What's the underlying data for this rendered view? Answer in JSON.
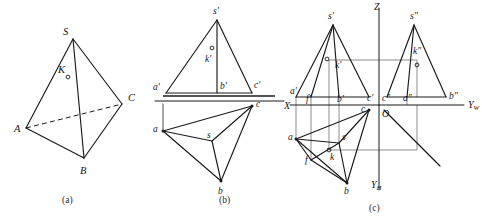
{
  "figure": {
    "panels": [
      {
        "id": "a",
        "caption": "(a)",
        "caption_x": 62,
        "caption_y": 203
      },
      {
        "id": "b",
        "caption": "(b)",
        "caption_x": 219,
        "caption_y": 203
      },
      {
        "id": "c",
        "caption": "(c)",
        "caption_x": 369,
        "caption_y": 211
      }
    ]
  },
  "panel_a": {
    "name": "pictorial-tetrahedron",
    "vertices": {
      "S": {
        "x": 73,
        "y": 39,
        "label": "S",
        "lx": 63,
        "ly": 35
      },
      "A": {
        "x": 26,
        "y": 128,
        "label": "A",
        "lx": 14,
        "ly": 132
      },
      "B": {
        "x": 84,
        "y": 158,
        "label": "B",
        "lx": 80,
        "ly": 174
      },
      "C": {
        "x": 122,
        "y": 104,
        "label": "C",
        "lx": 128,
        "ly": 101
      },
      "K": {
        "x": 68,
        "y": 77,
        "label": "K",
        "lx": 58,
        "ly": 73
      }
    },
    "edges": [
      {
        "from": "S",
        "to": "A",
        "style": "solid"
      },
      {
        "from": "S",
        "to": "B",
        "style": "solid"
      },
      {
        "from": "S",
        "to": "C",
        "style": "solid"
      },
      {
        "from": "A",
        "to": "B",
        "style": "solid"
      },
      {
        "from": "B",
        "to": "C",
        "style": "solid"
      },
      {
        "from": "A",
        "to": "C",
        "style": "dashed"
      }
    ]
  },
  "panel_b": {
    "name": "two-view-projection",
    "ground_line": {
      "x1": 163,
      "y1": 96,
      "x2": 275,
      "y2": 96
    },
    "xaxis_line": {
      "x1": 155,
      "y1": 101,
      "x2": 284,
      "y2": 101
    },
    "front_view": {
      "points": {
        "s_f": {
          "x": 217,
          "y": 20,
          "label": "s'",
          "lx": 213,
          "ly": 14
        },
        "a_f": {
          "x": 166,
          "y": 93,
          "label": "a'",
          "lx": 153,
          "ly": 90
        },
        "b_f": {
          "x": 217,
          "y": 93,
          "label": "b'",
          "lx": 220,
          "ly": 89
        },
        "c_f": {
          "x": 252,
          "y": 93,
          "label": "c'",
          "lx": 254,
          "ly": 88
        },
        "k_f": {
          "x": 212,
          "y": 55,
          "label": "k'",
          "lx": 205,
          "ly": 62
        }
      },
      "edges": [
        {
          "from": "s_f",
          "to": "a_f"
        },
        {
          "from": "s_f",
          "to": "c_f"
        },
        {
          "from": "s_f",
          "to": "b_f"
        },
        {
          "from": "a_f",
          "to": "c_f"
        }
      ]
    },
    "top_view": {
      "points": {
        "a_t": {
          "x": 163,
          "y": 131,
          "label": "a",
          "lx": 153,
          "ly": 132
        },
        "b_t": {
          "x": 221,
          "y": 181,
          "label": "b",
          "lx": 218,
          "ly": 194
        },
        "c_t": {
          "x": 252,
          "y": 106,
          "label": "c",
          "lx": 256,
          "ly": 107
        },
        "s_t": {
          "x": 212,
          "y": 141,
          "label": "s",
          "lx": 207,
          "ly": 138
        }
      },
      "edges": [
        {
          "from": "a_t",
          "to": "b_t"
        },
        {
          "from": "b_t",
          "to": "c_t"
        },
        {
          "from": "a_t",
          "to": "c_t"
        },
        {
          "from": "a_t",
          "to": "s_t"
        },
        {
          "from": "b_t",
          "to": "s_t"
        },
        {
          "from": "c_t",
          "to": "s_t"
        }
      ]
    }
  },
  "panel_c": {
    "name": "three-view-projection",
    "axes": {
      "origin": {
        "x": 379,
        "y": 105,
        "label": "O",
        "lx": 382,
        "ly": 117
      },
      "z_axis": {
        "x1": 379,
        "y1": 8,
        "x2": 379,
        "y2": 190,
        "label": "Z",
        "lx": 374,
        "ly": 10
      },
      "x_axis": {
        "x1": 290,
        "y1": 105,
        "x2": 379,
        "y2": 105,
        "label": "X",
        "lx": 284,
        "ly": 109
      },
      "yw_axis": {
        "x1": 379,
        "y1": 105,
        "x2": 464,
        "y2": 105,
        "label": "Y",
        "lx": 468,
        "ly": 108,
        "sub": "W"
      },
      "yh_axis": {
        "label": "Y",
        "lx": 371,
        "ly": 188,
        "sub": "H"
      },
      "miter_line": {
        "x1": 384,
        "y1": 110,
        "x2": 440,
        "y2": 166
      }
    },
    "front_view": {
      "points": {
        "s_f": {
          "x": 333,
          "y": 25,
          "label": "s'",
          "lx": 328,
          "ly": 19
        },
        "a_f": {
          "x": 296,
          "y": 97,
          "label": "a'",
          "lx": 290,
          "ly": 94
        },
        "f_f": {
          "x": 311,
          "y": 97,
          "label": "f'",
          "lx": 306,
          "ly": 102
        },
        "b_f": {
          "x": 339,
          "y": 97,
          "label": "b'",
          "lx": 337,
          "ly": 102
        },
        "c_f": {
          "x": 369,
          "y": 97,
          "label": "c'",
          "lx": 367,
          "ly": 101
        },
        "k_f": {
          "x": 329,
          "y": 60,
          "label": "k'",
          "lx": 335,
          "ly": 68
        }
      },
      "edges": [
        {
          "from": "s_f",
          "to": "a_f"
        },
        {
          "from": "s_f",
          "to": "c_f"
        },
        {
          "from": "s_f",
          "to": "b_f"
        },
        {
          "from": "s_f",
          "to": "f_f"
        },
        {
          "from": "a_f",
          "to": "c_f"
        }
      ]
    },
    "side_view": {
      "points": {
        "s_s": {
          "x": 414,
          "y": 25,
          "label": "s\"",
          "lx": 410,
          "ly": 19
        },
        "c_s": {
          "x": 387,
          "y": 97,
          "label": "c\"",
          "lx": 382,
          "ly": 101
        },
        "a_s": {
          "x": 407,
          "y": 97,
          "label": "a\"",
          "lx": 403,
          "ly": 101
        },
        "b_s": {
          "x": 446,
          "y": 97,
          "label": "b\"",
          "lx": 449,
          "ly": 99
        },
        "k_s": {
          "x": 417,
          "y": 60,
          "label": "k\"",
          "lx": 413,
          "ly": 54
        }
      },
      "edges": [
        {
          "from": "s_s",
          "to": "c_s"
        },
        {
          "from": "s_s",
          "to": "b_s"
        },
        {
          "from": "s_s",
          "to": "a_s"
        },
        {
          "from": "c_s",
          "to": "b_s"
        }
      ]
    },
    "top_view": {
      "points": {
        "a_t": {
          "x": 296,
          "y": 139,
          "label": "a",
          "lx": 288,
          "ly": 140
        },
        "b_t": {
          "x": 347,
          "y": 183,
          "label": "b",
          "lx": 344,
          "ly": 194
        },
        "c_t": {
          "x": 369,
          "y": 110,
          "label": "c",
          "lx": 361,
          "ly": 112
        },
        "s_t": {
          "x": 339,
          "y": 143,
          "label": "s",
          "lx": 342,
          "ly": 140
        },
        "f_t": {
          "x": 311,
          "y": 160,
          "label": "f",
          "lx": 305,
          "ly": 163
        },
        "k_t": {
          "x": 329,
          "y": 150,
          "label": "k",
          "lx": 330,
          "ly": 160
        }
      },
      "edges": [
        {
          "from": "a_t",
          "to": "b_t"
        },
        {
          "from": "b_t",
          "to": "c_t"
        },
        {
          "from": "a_t",
          "to": "c_t"
        },
        {
          "from": "a_t",
          "to": "s_t"
        },
        {
          "from": "b_t",
          "to": "s_t"
        },
        {
          "from": "c_t",
          "to": "s_t"
        },
        {
          "from": "a_t",
          "to": "f_t"
        },
        {
          "from": "f_t",
          "to": "b_t"
        },
        {
          "from": "f_t",
          "to": "s_t"
        }
      ]
    },
    "projection_lines": [
      {
        "x1": 296,
        "y1": 97,
        "x2": 296,
        "y2": 139
      },
      {
        "x1": 311,
        "y1": 97,
        "x2": 311,
        "y2": 160
      },
      {
        "x1": 339,
        "y1": 97,
        "x2": 339,
        "y2": 143
      },
      {
        "x1": 329,
        "y1": 60,
        "x2": 417,
        "y2": 60
      },
      {
        "x1": 329,
        "y1": 60,
        "x2": 329,
        "y2": 150
      },
      {
        "x1": 417,
        "y1": 60,
        "x2": 417,
        "y2": 97
      },
      {
        "x1": 417,
        "y1": 105,
        "x2": 417,
        "y2": 150
      },
      {
        "x1": 329,
        "y1": 150,
        "x2": 417,
        "y2": 150
      },
      {
        "x1": 407,
        "y1": 97,
        "x2": 407,
        "y2": 105
      }
    ]
  },
  "colors": {
    "ink": "#1a1a1a",
    "projection": "#8c8c8c",
    "ground": "#555555",
    "background": "#ffffff"
  }
}
